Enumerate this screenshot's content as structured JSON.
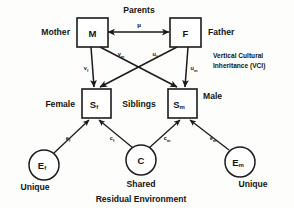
{
  "figure": {
    "type": "path-diagram",
    "title_top": "Parents",
    "bottom_caption": "Residual Environment",
    "background_color": "#fdfdfb",
    "line_color": "#1b1b1b"
  },
  "nodes": {
    "mother_box": {
      "label": "M",
      "sub": "",
      "side_label": "Mother"
    },
    "father_box": {
      "label": "F",
      "sub": "",
      "side_label": "Father"
    },
    "sib_female_box": {
      "label": "S",
      "sub": "f",
      "side_label": "Female"
    },
    "sib_male_box": {
      "label": "S",
      "sub": "m",
      "side_label": "Male"
    },
    "unique_female_circle": {
      "label": "E",
      "sub": "f",
      "side_label": "Unique"
    },
    "shared_circle": {
      "label": "C",
      "sub": "",
      "side_label": "Shared"
    },
    "unique_male_circle": {
      "label": "E",
      "sub": "m",
      "side_label": "Unique"
    }
  },
  "group_labels": {
    "parents": "Parents",
    "siblings": "Siblings",
    "vci_line1": "Vertical Cultural",
    "vci_line2": "Inheritance (VCI)",
    "residual_environment": "Residual Environment"
  },
  "paths": [
    {
      "name": "assortative-mating",
      "from": "M",
      "to": "F",
      "symbol": "μ",
      "sub": "",
      "arrow": "double"
    },
    {
      "name": "mother-to-daughter",
      "from": "M",
      "to": "Sf",
      "symbol": "v",
      "sub": "f",
      "arrow": "single"
    },
    {
      "name": "mother-to-son",
      "from": "M",
      "to": "Sm",
      "symbol": "v",
      "sub": "m",
      "arrow": "single"
    },
    {
      "name": "father-to-daughter",
      "from": "F",
      "to": "Sf",
      "symbol": "u",
      "sub": "f",
      "arrow": "single"
    },
    {
      "name": "father-to-son",
      "from": "F",
      "to": "Sm",
      "symbol": "u",
      "sub": "m",
      "arrow": "single"
    },
    {
      "name": "unique-female-to-daughter",
      "from": "Ef",
      "to": "Sf",
      "symbol": "e",
      "sub": "f",
      "arrow": "single"
    },
    {
      "name": "shared-to-daughter",
      "from": "C",
      "to": "Sf",
      "symbol": "c",
      "sub": "f",
      "arrow": "single"
    },
    {
      "name": "shared-to-son",
      "from": "C",
      "to": "Sm",
      "symbol": "c",
      "sub": "m",
      "arrow": "single"
    },
    {
      "name": "unique-male-to-son",
      "from": "Em",
      "to": "Sm",
      "symbol": "e",
      "sub": "m",
      "arrow": "single"
    }
  ]
}
